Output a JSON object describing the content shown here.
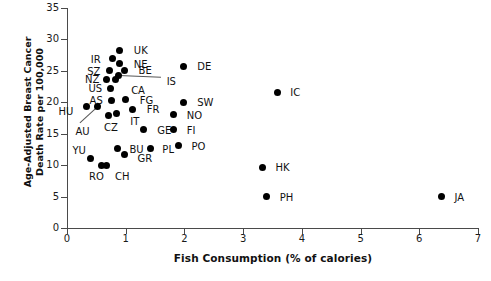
{
  "chart": {
    "type": "scatter",
    "title": "",
    "xlabel": "Fish Consumption (% of calories)",
    "ylabel": "Age-Adjusted Breast Cancer\nDeath Rate per 100,000",
    "ylabel_line1": "Age-Adjusted Breast Cancer",
    "ylabel_line2": "Death Rate per 100,000",
    "xlim": [
      0,
      7
    ],
    "ylim": [
      0,
      35
    ],
    "xticks": [
      "0",
      "1",
      "2",
      "3",
      "4",
      "5",
      "6",
      "7"
    ],
    "yticks": [
      "0",
      "5",
      "10",
      "15",
      "20",
      "25",
      "30",
      "35"
    ],
    "grid": false,
    "legend": "none",
    "marker_color": "#000000"
  },
  "chart_data": {
    "type": "scatter",
    "title": "",
    "xlabel": "Fish Consumption (% of calories)",
    "ylabel": "Age-Adjusted Breast Cancer Death Rate per 100,000",
    "xlim": [
      0,
      7
    ],
    "ylim": [
      0,
      35
    ],
    "xticks": [
      0,
      1,
      2,
      3,
      4,
      5,
      6,
      7
    ],
    "yticks": [
      0,
      5,
      10,
      15,
      20,
      25,
      30,
      35
    ],
    "grid": false,
    "legend_position": "none",
    "points": [
      {
        "label": "UK",
        "x": 0.9,
        "y": 28.3,
        "lx": 14,
        "ly": -4
      },
      {
        "label": "IR",
        "x": 0.78,
        "y": 26.9,
        "lx": -22,
        "ly": -4
      },
      {
        "label": "NE",
        "x": 0.9,
        "y": 26.1,
        "lx": 14,
        "ly": -4
      },
      {
        "label": "BE",
        "x": 0.98,
        "y": 25.1,
        "lx": 14,
        "ly": -4
      },
      {
        "label": "SZ",
        "x": 0.72,
        "y": 25.0,
        "lx": -22,
        "ly": -4
      },
      {
        "label": "NZ",
        "x": 0.68,
        "y": 23.7,
        "lx": -22,
        "ly": -4
      },
      {
        "label": "IS",
        "x": 0.88,
        "y": 24.3,
        "lx": 48,
        "ly": 2,
        "leader": true
      },
      {
        "label": "CA",
        "x": 0.82,
        "y": 23.6,
        "lx": 16,
        "ly": 6
      },
      {
        "label": "US",
        "x": 0.74,
        "y": 22.2,
        "lx": -22,
        "ly": -4
      },
      {
        "label": "AS",
        "x": 0.76,
        "y": 20.3,
        "lx": -22,
        "ly": -4
      },
      {
        "label": "FG",
        "x": 1.0,
        "y": 20.4,
        "lx": 14,
        "ly": -4
      },
      {
        "label": "FR",
        "x": 1.12,
        "y": 18.9,
        "lx": 14,
        "ly": -4
      },
      {
        "label": "HU",
        "x": 0.33,
        "y": 19.4,
        "lx": -28,
        "ly": 1
      },
      {
        "label": "AU",
        "x": 0.52,
        "y": 19.3,
        "lx": -22,
        "ly": 20,
        "leader": true
      },
      {
        "label": "CZ",
        "x": 0.7,
        "y": 17.9,
        "lx": -4,
        "ly": 8
      },
      {
        "label": "IT",
        "x": 0.84,
        "y": 18.2,
        "lx": 14,
        "ly": 3
      },
      {
        "label": "GE",
        "x": 1.3,
        "y": 15.6,
        "lx": 14,
        "ly": -4
      },
      {
        "label": "BU",
        "x": 0.86,
        "y": 12.6,
        "lx": 12,
        "ly": -4
      },
      {
        "label": "GR",
        "x": 0.98,
        "y": 11.7,
        "lx": 13,
        "ly": 0
      },
      {
        "label": "YU",
        "x": 0.4,
        "y": 11.0,
        "lx": -18,
        "ly": -13
      },
      {
        "label": "RO",
        "x": 0.58,
        "y": 10.0,
        "lx": -12,
        "ly": 7
      },
      {
        "label": "CH",
        "x": 0.68,
        "y": 10.0,
        "lx": 8,
        "ly": 7
      },
      {
        "label": "PL",
        "x": 1.42,
        "y": 12.6,
        "lx": 12,
        "ly": -4
      },
      {
        "label": "DE",
        "x": 1.98,
        "y": 25.7,
        "lx": 14,
        "ly": -4
      },
      {
        "label": "SW",
        "x": 1.98,
        "y": 20.0,
        "lx": 14,
        "ly": -4
      },
      {
        "label": "NO",
        "x": 1.82,
        "y": 18.0,
        "lx": 13,
        "ly": -4
      },
      {
        "label": "FI",
        "x": 1.82,
        "y": 15.6,
        "lx": 13,
        "ly": -4
      },
      {
        "label": "PO",
        "x": 1.9,
        "y": 13.1,
        "lx": 13,
        "ly": -4
      },
      {
        "label": "IC",
        "x": 3.58,
        "y": 21.6,
        "lx": 13,
        "ly": -4
      },
      {
        "label": "HK",
        "x": 3.33,
        "y": 9.7,
        "lx": 13,
        "ly": -4
      },
      {
        "label": "PH",
        "x": 3.4,
        "y": 5.0,
        "lx": 13,
        "ly": -4
      },
      {
        "label": "JA",
        "x": 6.38,
        "y": 5.0,
        "lx": 13,
        "ly": -4
      }
    ]
  }
}
